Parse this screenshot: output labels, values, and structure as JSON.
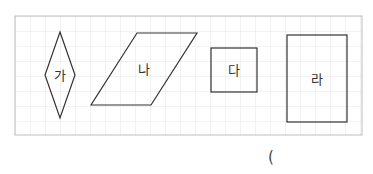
{
  "figure": {
    "grid": {
      "spacing": 15,
      "line_color": "#e4e4e4",
      "frame_color": "#bdbdbd"
    },
    "shapes": [
      {
        "id": "ga",
        "label": "가",
        "type": "rhombus"
      },
      {
        "id": "na",
        "label": "나",
        "type": "parallelogram"
      },
      {
        "id": "da",
        "label": "다",
        "type": "square"
      },
      {
        "id": "ra",
        "label": "라",
        "type": "rectangle"
      }
    ]
  },
  "answer": {
    "open_paren": "("
  }
}
